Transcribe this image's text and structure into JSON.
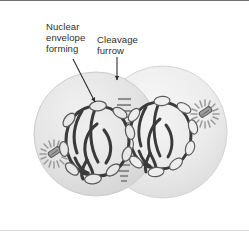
{
  "figure": {
    "background_color": "#ffffff",
    "frame_top_color": "#6f6f6f",
    "frame_bottom_color": "#d8d8d8"
  },
  "labels": [
    {
      "id": "nuclear-envelope-forming",
      "text": "Nuclear\nenvelope\nforming",
      "lines": [
        "Nuclear",
        "envelope",
        "forming"
      ],
      "x": 46,
      "y": 20,
      "color": "#2e2e2e",
      "leader": {
        "type": "arrow",
        "from": [
          75,
          60
        ],
        "to": [
          95,
          103
        ],
        "style": "diagonal"
      }
    },
    {
      "id": "cleavage-furrow",
      "text": "Cleavage\nfurrow",
      "lines": [
        "Cleavage",
        "furrow"
      ],
      "x": 97,
      "y": 33,
      "color": "#2e2e2e",
      "leader": {
        "type": "arrow",
        "from": [
          117,
          56
        ],
        "to": [
          117,
          81
        ],
        "style": "vertical"
      }
    }
  ],
  "cells": [
    {
      "id": "daughter-cell-left",
      "name": "left daughter cell",
      "center": [
        96,
        133
      ],
      "radius_x": 62,
      "radius_y": 62,
      "fill": "#e2e2e2",
      "stroke": "#cfcfcf",
      "nucleus": {
        "id": "reforming-nucleus-left",
        "center": [
          97,
          139
        ],
        "radius_x": 33,
        "radius_y": 35,
        "chromatin_color": "#3a3a3a",
        "interior_fill": "#ebebeb"
      },
      "aster": {
        "id": "aster-left",
        "center": [
          54,
          153
        ],
        "radius": 15,
        "ray_count": 18,
        "color": "#9a9a9a",
        "centriole_color": "#6a6a6a"
      },
      "vesicle_count": 9,
      "vesicle_fill": "#e8e8e8",
      "vesicle_stroke": "#5d5d5d"
    },
    {
      "id": "daughter-cell-right",
      "name": "right daughter cell",
      "center": [
        163,
        131
      ],
      "radius_x": 64,
      "radius_y": 66,
      "fill": "#eaeaea",
      "stroke": "#d4d4d4",
      "nucleus": {
        "id": "reforming-nucleus-right",
        "center": [
          160,
          134
        ],
        "radius_x": 32,
        "radius_y": 34,
        "chromatin_color": "#3a3a3a",
        "interior_fill": "#f0f0f0"
      },
      "aster": {
        "id": "aster-right",
        "center": [
          205,
          113
        ],
        "radius": 15,
        "ray_count": 18,
        "color": "#9a9a9a",
        "centriole_color": "#6a6a6a"
      },
      "vesicle_count": 9,
      "vesicle_fill": "#eeeeee",
      "vesicle_stroke": "#5d5d5d"
    }
  ],
  "cleavage_furrow": {
    "id": "contractile-ring-dashes",
    "description": "stacked horizontal dashes marking the cleavage furrow / midbody",
    "x_left": 116,
    "x_right": 132,
    "y_top": 96,
    "y_bottom": 176,
    "dash_count": 15,
    "color": "#8e8e8e"
  },
  "colors": {
    "text": "#2e2e2e",
    "cytoplasm_left": "#e2e2e2",
    "cytoplasm_right": "#eaeaea",
    "chromatin": "#3a3a3a",
    "aster": "#9a9a9a",
    "furrow": "#8e8e8e",
    "leader_line": "#2e2e2e"
  }
}
